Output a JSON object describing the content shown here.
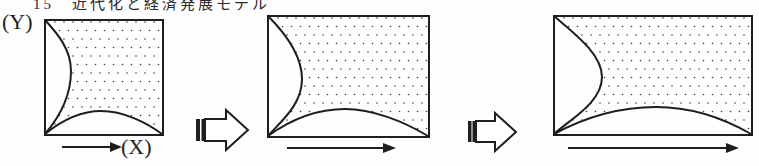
{
  "caption": {
    "text": "15　近代化と経済発展モデル",
    "visibility": "clipped-at-top-edge"
  },
  "axes": {
    "y_label": "(Y)",
    "x_label": "(X)"
  },
  "diagram": {
    "type": "process-diagram",
    "stages": [
      {
        "name": "stage-1",
        "shape": "square",
        "relative_width": "small",
        "fill": "dot-stipple",
        "underline_arrow": "short"
      },
      {
        "name": "stage-2",
        "shape": "wide-rectangle",
        "relative_width": "medium",
        "fill": "dot-stipple",
        "underline_arrow": "medium"
      },
      {
        "name": "stage-3",
        "shape": "wider-rectangle",
        "relative_width": "large",
        "fill": "dot-stipple",
        "underline_arrow": "long"
      }
    ],
    "transition_arrows": [
      {
        "name": "transition-1",
        "style": "hollow-block-arrow-double-bar-tail",
        "direction": "right"
      },
      {
        "name": "transition-2",
        "style": "hollow-block-arrow-double-bar-tail",
        "direction": "right"
      }
    ]
  },
  "colors": {
    "background": "#fefefe",
    "line": "#1e1e1e",
    "stipple_dot": "#3a3a3a"
  }
}
